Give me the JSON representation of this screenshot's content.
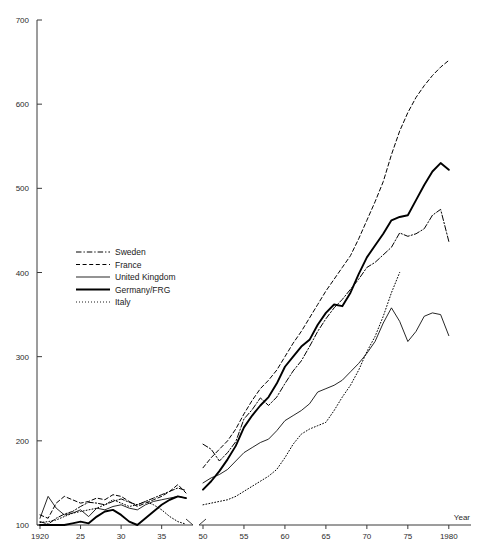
{
  "chart_data": {
    "type": "line",
    "title": "",
    "xlabel": "Year",
    "ylabel": "",
    "ylim": [
      100,
      700
    ],
    "y_ticks": [
      100,
      200,
      300,
      400,
      500,
      600,
      700
    ],
    "y_tick_labels": [
      "100",
      "200",
      "300",
      "400",
      "500",
      "600",
      "700"
    ],
    "grid": false,
    "legend_position": "middle-left",
    "panels": [
      {
        "name": "left-panel",
        "xlim": [
          1920,
          1938
        ],
        "x_ticks": [
          1920,
          1925,
          1930,
          1935
        ],
        "x_tick_labels": [
          "1920",
          "25",
          "30",
          "35"
        ]
      },
      {
        "name": "right-panel",
        "xlim": [
          1950,
          1981
        ],
        "x_ticks": [
          1950,
          1955,
          1960,
          1965,
          1970,
          1975,
          1980
        ],
        "x_tick_labels": [
          "50",
          "55",
          "60",
          "65",
          "70",
          "75",
          "1980"
        ]
      }
    ],
    "series": [
      {
        "name": "Sweden",
        "style": "dash-dot",
        "color": "#000000",
        "width": 1.0,
        "left_x": [
          1920,
          1921,
          1922,
          1923,
          1924,
          1925,
          1926,
          1927,
          1928,
          1929,
          1930,
          1931,
          1932,
          1933,
          1934,
          1935,
          1936,
          1937,
          1938
        ],
        "left_y": [
          104,
          101,
          108,
          113,
          116,
          122,
          127,
          126,
          124,
          128,
          131,
          127,
          124,
          128,
          132,
          136,
          140,
          144,
          141
        ],
        "right_x": [
          1950,
          1951,
          1952,
          1953,
          1954,
          1955,
          1956,
          1957,
          1958,
          1959,
          1960,
          1961,
          1962,
          1963,
          1964,
          1965,
          1966,
          1967,
          1968,
          1969,
          1970,
          1971,
          1972,
          1973,
          1974,
          1975,
          1976,
          1977,
          1978,
          1979,
          1980
        ],
        "right_y": [
          196,
          190,
          176,
          186,
          199,
          226,
          237,
          251,
          242,
          252,
          268,
          283,
          295,
          312,
          330,
          345,
          358,
          368,
          380,
          392,
          406,
          412,
          421,
          430,
          447,
          443,
          446,
          452,
          468,
          475,
          437
        ]
      },
      {
        "name": "France",
        "style": "dashed",
        "color": "#000000",
        "width": 1.0,
        "left_x": [
          1920,
          1921,
          1922,
          1923,
          1924,
          1925,
          1926,
          1927,
          1928,
          1929,
          1930,
          1931,
          1932,
          1933,
          1934,
          1935,
          1936,
          1937,
          1938
        ],
        "left_y": [
          112,
          108,
          126,
          134,
          130,
          126,
          128,
          132,
          130,
          136,
          134,
          128,
          122,
          126,
          130,
          134,
          140,
          148,
          138
        ],
        "right_x": [
          1950,
          1951,
          1952,
          1953,
          1954,
          1955,
          1956,
          1957,
          1958,
          1959,
          1960,
          1961,
          1962,
          1963,
          1964,
          1965,
          1966,
          1967,
          1968,
          1969,
          1970,
          1971,
          1972,
          1973,
          1974,
          1975,
          1976,
          1977,
          1978,
          1979,
          1980
        ],
        "right_y": [
          168,
          180,
          190,
          200,
          214,
          232,
          248,
          262,
          272,
          284,
          300,
          316,
          330,
          346,
          362,
          378,
          392,
          406,
          420,
          440,
          462,
          484,
          508,
          540,
          568,
          590,
          608,
          622,
          634,
          644,
          652
        ]
      },
      {
        "name": "United Kingdom",
        "style": "solid-thin",
        "color": "#000000",
        "width": 1.0,
        "left_x": [
          1920,
          1921,
          1922,
          1923,
          1924,
          1925,
          1926,
          1927,
          1928,
          1929,
          1930,
          1931,
          1932,
          1933,
          1934,
          1935,
          1936,
          1937,
          1938
        ],
        "left_y": [
          108,
          134,
          120,
          112,
          114,
          118,
          110,
          120,
          118,
          122,
          124,
          120,
          118,
          124,
          128,
          130,
          132,
          134,
          132
        ],
        "right_x": [
          1950,
          1951,
          1952,
          1953,
          1954,
          1955,
          1956,
          1957,
          1958,
          1959,
          1960,
          1961,
          1962,
          1963,
          1964,
          1965,
          1966,
          1967,
          1968,
          1969,
          1970,
          1971,
          1972,
          1973,
          1974,
          1975,
          1976,
          1977,
          1978,
          1979,
          1980
        ],
        "right_y": [
          150,
          156,
          160,
          166,
          176,
          186,
          192,
          198,
          202,
          212,
          224,
          230,
          236,
          244,
          258,
          262,
          266,
          272,
          282,
          292,
          304,
          318,
          340,
          358,
          342,
          318,
          330,
          348,
          352,
          350,
          325
        ]
      },
      {
        "name": "Germany/FRG",
        "style": "solid-thick",
        "color": "#000000",
        "width": 2.0,
        "left_x": [
          1920,
          1921,
          1922,
          1923,
          1924,
          1925,
          1926,
          1927,
          1928,
          1929,
          1930,
          1931,
          1932,
          1933,
          1934,
          1935,
          1936,
          1937,
          1938
        ],
        "left_y": [
          100,
          100,
          100,
          100,
          102,
          104,
          102,
          110,
          116,
          118,
          112,
          104,
          100,
          108,
          116,
          124,
          130,
          134,
          132
        ],
        "right_x": [
          1950,
          1951,
          1952,
          1953,
          1954,
          1955,
          1956,
          1957,
          1958,
          1959,
          1960,
          1961,
          1962,
          1963,
          1964,
          1965,
          1966,
          1967,
          1968,
          1969,
          1970,
          1971,
          1972,
          1973,
          1974,
          1975,
          1976,
          1977,
          1978,
          1979,
          1980
        ],
        "right_y": [
          142,
          152,
          164,
          178,
          194,
          216,
          230,
          242,
          252,
          268,
          288,
          300,
          312,
          320,
          338,
          352,
          362,
          360,
          376,
          398,
          418,
          432,
          446,
          462,
          466,
          468,
          486,
          504,
          520,
          530,
          522
        ]
      },
      {
        "name": "Italy",
        "style": "dotted",
        "color": "#000000",
        "width": 1.0,
        "left_x": [
          1920,
          1921,
          1922,
          1923,
          1924,
          1925,
          1926,
          1927,
          1928,
          1929,
          1930,
          1931,
          1932,
          1933,
          1934,
          1935,
          1936,
          1937,
          1938
        ],
        "left_y": [
          103,
          104,
          106,
          110,
          114,
          116,
          118,
          120,
          124,
          130,
          126,
          122,
          124,
          128,
          124,
          118,
          110,
          104,
          101
        ],
        "right_x": [
          1950,
          1951,
          1952,
          1953,
          1954,
          1955,
          1956,
          1957,
          1958,
          1959,
          1960,
          1961,
          1962,
          1963,
          1964,
          1965,
          1966,
          1967,
          1968,
          1969,
          1970,
          1971,
          1972,
          1973,
          1974
        ],
        "right_y": [
          124,
          126,
          128,
          130,
          134,
          140,
          146,
          152,
          158,
          166,
          180,
          196,
          208,
          214,
          218,
          222,
          236,
          252,
          266,
          284,
          306,
          324,
          348,
          376,
          400
        ]
      }
    ]
  },
  "legend": {
    "items": [
      {
        "label": "Sweden"
      },
      {
        "label": "France"
      },
      {
        "label": "United Kingdom"
      },
      {
        "label": "Germany/FRG"
      },
      {
        "label": "Italy"
      }
    ]
  },
  "axes": {
    "x_axis_title": "Year",
    "left_x_labels": [
      "1920",
      "25",
      "30",
      "35"
    ],
    "right_x_labels": [
      "50",
      "55",
      "60",
      "65",
      "70",
      "75",
      "1980"
    ],
    "y_labels": [
      "700",
      "600",
      "500",
      "400",
      "300",
      "200",
      "100"
    ]
  }
}
